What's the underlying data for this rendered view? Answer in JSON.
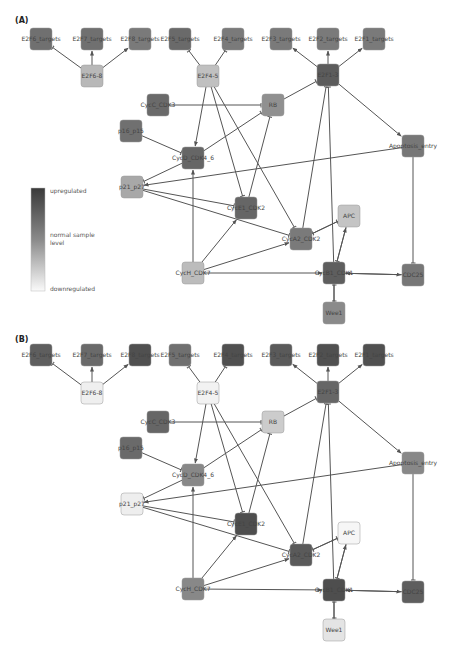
{
  "panels": [
    {
      "label": "(A)",
      "nodes": [
        {
          "id": "E2F6_targets_a",
          "label": "E2F6_targets",
          "x": 41,
          "y": 39,
          "fill": "#707070"
        },
        {
          "id": "E2F7_targets",
          "label": "E2F7_targets",
          "x": 92,
          "y": 39,
          "fill": "#707070"
        },
        {
          "id": "E2F8_targets",
          "label": "E2F8_targets",
          "x": 140,
          "y": 39,
          "fill": "#7a7a7a"
        },
        {
          "id": "E2F5_targets",
          "label": "E2F5_targets",
          "x": 180,
          "y": 39,
          "fill": "#6a6a6a"
        },
        {
          "id": "E2F4_targets",
          "label": "E2F4_targets",
          "x": 233,
          "y": 39,
          "fill": "#7a7a7a"
        },
        {
          "id": "E2F3_targets",
          "label": "E2F3_targets",
          "x": 281,
          "y": 39,
          "fill": "#7a7a7a"
        },
        {
          "id": "E2F2_targets",
          "label": "E2F2_targets",
          "x": 328,
          "y": 39,
          "fill": "#7a7a7a"
        },
        {
          "id": "E2F1_targets",
          "label": "E2F1_targets",
          "x": 374,
          "y": 39,
          "fill": "#7a7a7a"
        },
        {
          "id": "E2F6-8",
          "label": "E2F6-8",
          "x": 92,
          "y": 76,
          "fill": "#b8b8b8"
        },
        {
          "id": "E2F4-5",
          "label": "E2F4-5",
          "x": 208,
          "y": 76,
          "fill": "#c0c0c0"
        },
        {
          "id": "E2F1-3",
          "label": "E2F1-3",
          "x": 328,
          "y": 75,
          "fill": "#5c5c5c"
        },
        {
          "id": "CycC_CDK3",
          "label": "CycC_CDK3",
          "x": 158,
          "y": 105,
          "fill": "#6a6a6a"
        },
        {
          "id": "RB",
          "label": "RB",
          "x": 273,
          "y": 105,
          "fill": "#909090"
        },
        {
          "id": "p16_p15",
          "label": "p16_p15",
          "x": 131,
          "y": 131,
          "fill": "#707070"
        },
        {
          "id": "CycD_CDK4_6",
          "label": "CycD_CDK4_6",
          "x": 193,
          "y": 158,
          "fill": "#666666"
        },
        {
          "id": "Apoptosis_entry",
          "label": "Apoptosis_entry",
          "x": 413,
          "y": 146,
          "fill": "#777777"
        },
        {
          "id": "p21_p27",
          "label": "p21_p27",
          "x": 132,
          "y": 187,
          "fill": "#a8a8a8"
        },
        {
          "id": "CycE1_CDK2",
          "label": "CycE1_CDK2",
          "x": 246,
          "y": 208,
          "fill": "#666666"
        },
        {
          "id": "APC",
          "label": "APC",
          "x": 349,
          "y": 216,
          "fill": "#c4c4c4"
        },
        {
          "id": "CycA2_CDK2",
          "label": "CycA2_CDK2",
          "x": 301,
          "y": 239,
          "fill": "#7a7a7a"
        },
        {
          "id": "CycH_CDK7",
          "label": "CycH_CDK7",
          "x": 193,
          "y": 273,
          "fill": "#bcbcbc"
        },
        {
          "id": "CycB1_CDK1",
          "label": "CycB1_CDK1",
          "x": 334,
          "y": 273,
          "fill": "#5e5e5e"
        },
        {
          "id": "CDC25",
          "label": "CDC25",
          "x": 413,
          "y": 275,
          "fill": "#777777"
        },
        {
          "id": "Wee1",
          "label": "Wee1",
          "x": 334,
          "y": 313,
          "fill": "#8a8a8a"
        }
      ]
    },
    {
      "label": "(B)",
      "nodes": [
        {
          "id": "E2F6_targets_b",
          "label": "E2F6_targets",
          "x": 41,
          "y": 355,
          "fill": "#5e5e5e"
        },
        {
          "id": "E2F7_targets",
          "label": "E2F7_targets",
          "x": 92,
          "y": 355,
          "fill": "#6a6a6a"
        },
        {
          "id": "E2F8_targets",
          "label": "E2F8_targets",
          "x": 140,
          "y": 355,
          "fill": "#505050"
        },
        {
          "id": "E2F5_targets",
          "label": "E2F5_targets",
          "x": 180,
          "y": 355,
          "fill": "#707070"
        },
        {
          "id": "E2F4_targets",
          "label": "E2F4_targets",
          "x": 233,
          "y": 355,
          "fill": "#505050"
        },
        {
          "id": "E2F3_targets",
          "label": "E2F3_targets",
          "x": 281,
          "y": 355,
          "fill": "#5a5a5a"
        },
        {
          "id": "E2F2_targets",
          "label": "E2F2_targets",
          "x": 328,
          "y": 355,
          "fill": "#505050"
        },
        {
          "id": "E2F1_targets",
          "label": "E2F1_targets",
          "x": 374,
          "y": 355,
          "fill": "#505050"
        },
        {
          "id": "E2F6-8",
          "label": "E2F6-8",
          "x": 92,
          "y": 393,
          "fill": "#efefef"
        },
        {
          "id": "E2F4-5",
          "label": "E2F4-5",
          "x": 208,
          "y": 393,
          "fill": "#f2f2f2"
        },
        {
          "id": "E2F1-3",
          "label": "E2F1-3",
          "x": 328,
          "y": 392,
          "fill": "#666666"
        },
        {
          "id": "CycC_CDK3",
          "label": "CycC_CDK3",
          "x": 158,
          "y": 422,
          "fill": "#666666"
        },
        {
          "id": "RB",
          "label": "RB",
          "x": 273,
          "y": 422,
          "fill": "#cccccc"
        },
        {
          "id": "p16_p15",
          "label": "p16_p15",
          "x": 131,
          "y": 448,
          "fill": "#6a6a6a"
        },
        {
          "id": "CycD_CDK4_6",
          "label": "CycD_CDK4_6",
          "x": 193,
          "y": 475,
          "fill": "#888888"
        },
        {
          "id": "Apoptosis_entry",
          "label": "Apoptosis_entry",
          "x": 413,
          "y": 463,
          "fill": "#888888"
        },
        {
          "id": "p21_p27",
          "label": "p21_p27",
          "x": 132,
          "y": 504,
          "fill": "#eeeeee"
        },
        {
          "id": "CycE1_CDK2",
          "label": "CycE1_CDK2",
          "x": 246,
          "y": 524,
          "fill": "#4e4e4e"
        },
        {
          "id": "APC",
          "label": "APC",
          "x": 349,
          "y": 533,
          "fill": "#f6f6f6"
        },
        {
          "id": "CycA2_CDK2",
          "label": "CycA2_CDK2",
          "x": 301,
          "y": 555,
          "fill": "#5a5a5a"
        },
        {
          "id": "CycH_CDK7",
          "label": "CycH_CDK7",
          "x": 193,
          "y": 589,
          "fill": "#888888"
        },
        {
          "id": "CycB1_CDK1",
          "label": "CycB1_CDK1",
          "x": 334,
          "y": 590,
          "fill": "#4e4e4e"
        },
        {
          "id": "CDC25",
          "label": "CDC25",
          "x": 413,
          "y": 592,
          "fill": "#5e5e5e"
        },
        {
          "id": "Wee1",
          "label": "Wee1",
          "x": 334,
          "y": 630,
          "fill": "#e4e4e4"
        }
      ]
    }
  ],
  "legend": {
    "top_label": "upregulated",
    "mid_label": "normal sample level",
    "mid_label_line1": "normal sample",
    "mid_label_line2": "level",
    "bottom_label": "downregulated",
    "top_color": "#3a3a3a",
    "bottom_color": "#fafafa"
  },
  "edges": [
    [
      "E2F6-8",
      "E2F6_targets",
      "inhibit"
    ],
    [
      "E2F6-8",
      "E2F7_targets",
      "activate"
    ],
    [
      "E2F6-8",
      "E2F8_targets",
      "activate"
    ],
    [
      "E2F4-5",
      "E2F5_targets",
      "inhibit"
    ],
    [
      "E2F4-5",
      "E2F4_targets",
      "inhibit"
    ],
    [
      "E2F1-3",
      "E2F3_targets",
      "activate"
    ],
    [
      "E2F1-3",
      "E2F2_targets",
      "activate"
    ],
    [
      "E2F1-3",
      "E2F1_targets",
      "activate"
    ],
    [
      "CycC_CDK3",
      "RB",
      "inhibit"
    ],
    [
      "RB",
      "E2F1-3",
      "inhibit"
    ],
    [
      "p16_p15",
      "CycD_CDK4_6",
      "inhibit"
    ],
    [
      "CycD_CDK4_6",
      "RB",
      "inhibit"
    ],
    [
      "CycD_CDK4_6",
      "p21_p27",
      "inhibit"
    ],
    [
      "E2F4-5",
      "CycD_CDK4_6",
      "activate"
    ],
    [
      "E2F4-5",
      "CycE1_CDK2",
      "inhibit"
    ],
    [
      "E2F4-5",
      "CycA2_CDK2",
      "inhibit"
    ],
    [
      "p21_p27",
      "CycE1_CDK2",
      "inhibit"
    ],
    [
      "p21_p27",
      "CycA2_CDK2",
      "inhibit"
    ],
    [
      "Apoptosis_entry",
      "p21_p27",
      "activate"
    ],
    [
      "CycE1_CDK2",
      "RB",
      "inhibit"
    ],
    [
      "CycA2_CDK2",
      "E2F1-3",
      "inhibit"
    ],
    [
      "CycA2_CDK2",
      "APC",
      "inhibit"
    ],
    [
      "APC",
      "CycA2_CDK2",
      "inhibit"
    ],
    [
      "APC",
      "CycB1_CDK1",
      "inhibit"
    ],
    [
      "CycB1_CDK1",
      "APC",
      "activate"
    ],
    [
      "CycH_CDK7",
      "CycD_CDK4_6",
      "activate"
    ],
    [
      "CycH_CDK7",
      "CycE1_CDK2",
      "activate"
    ],
    [
      "CycH_CDK7",
      "CycA2_CDK2",
      "activate"
    ],
    [
      "CycH_CDK7",
      "CycB1_CDK1",
      "activate"
    ],
    [
      "CDC25",
      "CycB1_CDK1",
      "activate"
    ],
    [
      "CycB1_CDK1",
      "CDC25",
      "activate"
    ],
    [
      "Apoptosis_entry",
      "CDC25",
      "inhibit"
    ],
    [
      "E2F1-3",
      "Apoptosis_entry",
      "activate"
    ],
    [
      "Wee1",
      "CycB1_CDK1",
      "inhibit"
    ],
    [
      "CycB1_CDK1",
      "Wee1",
      "inhibit"
    ],
    [
      "CycB1_CDK1",
      "E2F1-3",
      "inhibit"
    ]
  ]
}
